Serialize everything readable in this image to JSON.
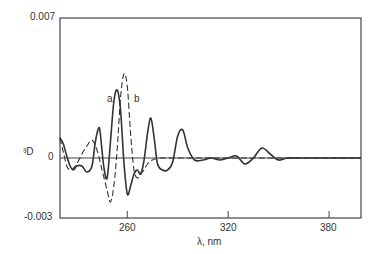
{
  "chart_data": {
    "type": "line",
    "title": "",
    "xlabel": "λ, nm",
    "ylabel": "³D",
    "xlim": [
      220,
      399
    ],
    "ylim": [
      -0.003,
      0.007
    ],
    "x_ticks": [
      "260",
      "320",
      "380"
    ],
    "y_ticks": [
      "0.007",
      "0",
      "-0.003"
    ],
    "grid": false,
    "legend": "inline labels",
    "series": [
      {
        "name": "a",
        "style": "solid",
        "x": [
          220,
          222,
          224,
          226,
          228,
          230,
          233,
          236,
          239,
          241,
          243,
          244,
          246,
          248,
          250,
          252,
          254,
          256,
          258,
          260,
          262,
          264,
          266,
          268,
          270,
          272,
          274,
          276,
          278,
          281,
          284,
          287,
          290,
          293,
          296,
          300,
          305,
          310,
          315,
          320,
          325,
          330,
          335,
          340,
          345,
          350,
          355,
          360,
          370,
          380,
          399
        ],
        "y": [
          0.001,
          0.0007,
          0.0001,
          -0.0004,
          -0.0006,
          -0.0004,
          -0.0004,
          -0.0007,
          -0.0004,
          0.0008,
          0.0015,
          0.0012,
          -0.0004,
          -0.001,
          0.0008,
          0.0028,
          0.0034,
          0.0024,
          -0.0002,
          -0.0018,
          -0.0014,
          -0.0008,
          -0.0006,
          -0.0008,
          -0.0001,
          0.0012,
          0.002,
          0.001,
          -0.0003,
          -0.0006,
          -0.0006,
          -0.0002,
          0.0011,
          0.0014,
          0.0005,
          -0.0001,
          -0.0001,
          0.0,
          -0.0001,
          0.0,
          0.0001,
          -0.0003,
          0.0,
          0.0005,
          0.0002,
          -0.0001,
          0.0,
          0.0,
          0.0,
          0.0,
          0.0
        ]
      },
      {
        "name": "b",
        "style": "dashed",
        "x": [
          220,
          222,
          224,
          226,
          228,
          230,
          233,
          236,
          239,
          242,
          245,
          248,
          250,
          252,
          254,
          256,
          258,
          260,
          262,
          264,
          266,
          268,
          270,
          272,
          275,
          280,
          290,
          300,
          320,
          340,
          360,
          380,
          399
        ],
        "y": [
          0.001,
          0.0003,
          -0.0004,
          -0.0006,
          -0.0005,
          -0.0003,
          0.0002,
          0.0006,
          0.0009,
          0.0004,
          -0.0006,
          -0.0016,
          -0.0022,
          -0.0014,
          0.0004,
          0.003,
          0.0042,
          0.0036,
          0.0012,
          -0.0006,
          -0.001,
          -0.0008,
          -0.0006,
          -0.0003,
          -0.0001,
          0.0,
          0.0,
          0.0,
          0.0,
          0.0,
          0.0,
          0.0,
          0.0
        ]
      }
    ],
    "annotations": [
      {
        "text": "a",
        "x": 249,
        "y": 0.0033
      },
      {
        "text": "b",
        "x": 264,
        "y": 0.0033
      }
    ]
  }
}
